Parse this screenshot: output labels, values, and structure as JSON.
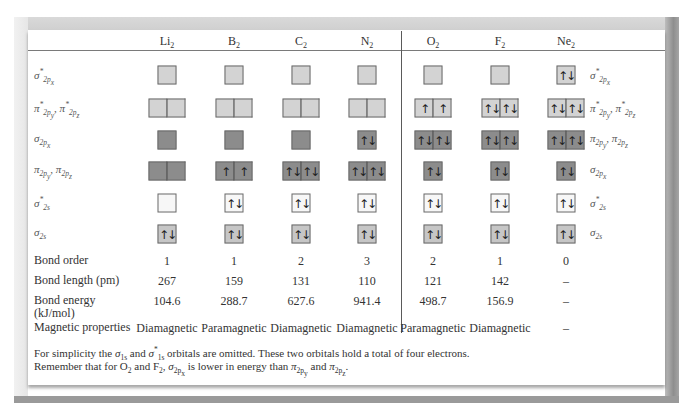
{
  "molecules": [
    {
      "symbol": "Li",
      "subscript": "2"
    },
    {
      "symbol": "B",
      "subscript": "2"
    },
    {
      "symbol": "C",
      "subscript": "2"
    },
    {
      "symbol": "N",
      "subscript": "2"
    },
    {
      "symbol": "O",
      "subscript": "2"
    },
    {
      "symbol": "F",
      "subscript": "2"
    },
    {
      "symbol": "Ne",
      "subscript": "2"
    }
  ],
  "orbital_rows": [
    {
      "key": "sigma_star_2px",
      "left_label": {
        "base": "σ",
        "sup": "*",
        "sub": "2p",
        "subsub": "x"
      },
      "right_label_b2_n2": null,
      "cells": [
        {
          "boxes": [
            ""
          ],
          "shade": "light"
        },
        {
          "boxes": [
            ""
          ],
          "shade": "light"
        },
        {
          "boxes": [
            ""
          ],
          "shade": "light"
        },
        {
          "boxes": [
            ""
          ],
          "shade": "light"
        },
        {
          "boxes": [
            ""
          ],
          "shade": "light"
        },
        {
          "boxes": [
            ""
          ],
          "shade": "light"
        },
        {
          "boxes": [
            "↑↓"
          ],
          "shade": "light"
        }
      ]
    },
    {
      "key": "pi_star_2py_2pz",
      "left_label": "π*2py, π*2pz",
      "cells": [
        {
          "boxes": [
            "",
            ""
          ],
          "shade": "light"
        },
        {
          "boxes": [
            "",
            ""
          ],
          "shade": "light"
        },
        {
          "boxes": [
            "",
            ""
          ],
          "shade": "light"
        },
        {
          "boxes": [
            "",
            ""
          ],
          "shade": "light"
        },
        {
          "boxes": [
            "↑",
            "↑"
          ],
          "shade": "light"
        },
        {
          "boxes": [
            "↑↓",
            "↑↓"
          ],
          "shade": "light"
        },
        {
          "boxes": [
            "↑↓",
            "↑↓"
          ],
          "shade": "light"
        }
      ]
    },
    {
      "key": "row3",
      "left_label": "σ2px",
      "right_label": "π2py, π2pz",
      "cells": [
        {
          "boxes": [
            ""
          ],
          "shade": "dark"
        },
        {
          "boxes": [
            ""
          ],
          "shade": "dark"
        },
        {
          "boxes": [
            ""
          ],
          "shade": "dark"
        },
        {
          "boxes": [
            "↑↓"
          ],
          "shade": "dark"
        },
        {
          "boxes": [
            "↑↓",
            "↑↓"
          ],
          "shade": "dark"
        },
        {
          "boxes": [
            "↑↓",
            "↑↓"
          ],
          "shade": "dark"
        },
        {
          "boxes": [
            "↑↓",
            "↑↓"
          ],
          "shade": "dark"
        }
      ]
    },
    {
      "key": "row4",
      "left_label": "π2py, π2pz",
      "right_label": "σ2px",
      "cells": [
        {
          "boxes": [
            "",
            ""
          ],
          "shade": "dark"
        },
        {
          "boxes": [
            "↑",
            "↑"
          ],
          "shade": "dark"
        },
        {
          "boxes": [
            "↑↓",
            "↑↓"
          ],
          "shade": "dark"
        },
        {
          "boxes": [
            "↑↓",
            "↑↓"
          ],
          "shade": "dark"
        },
        {
          "boxes": [
            "↑↓"
          ],
          "shade": "dark"
        },
        {
          "boxes": [
            "↑↓"
          ],
          "shade": "dark"
        },
        {
          "boxes": [
            "↑↓"
          ],
          "shade": "dark"
        }
      ]
    },
    {
      "key": "sigma_star_2s",
      "left_label": "σ*2s",
      "right_label": "σ*2s",
      "cells": [
        {
          "boxes": [
            ""
          ],
          "shade": "white"
        },
        {
          "boxes": [
            "↑↓"
          ],
          "shade": "white"
        },
        {
          "boxes": [
            "↑↓"
          ],
          "shade": "white"
        },
        {
          "boxes": [
            "↑↓"
          ],
          "shade": "white"
        },
        {
          "boxes": [
            "↑↓"
          ],
          "shade": "white"
        },
        {
          "boxes": [
            "↑↓"
          ],
          "shade": "white"
        },
        {
          "boxes": [
            "↑↓"
          ],
          "shade": "white"
        }
      ]
    },
    {
      "key": "sigma_2s",
      "left_label": "σ2s",
      "right_label": "σ2s",
      "cells": [
        {
          "boxes": [
            "↑↓"
          ],
          "shade": "mid"
        },
        {
          "boxes": [
            "↑↓"
          ],
          "shade": "mid"
        },
        {
          "boxes": [
            "↑↓"
          ],
          "shade": "mid"
        },
        {
          "boxes": [
            "↑↓"
          ],
          "shade": "mid"
        },
        {
          "boxes": [
            "↑↓"
          ],
          "shade": "mid"
        },
        {
          "boxes": [
            "↑↓"
          ],
          "shade": "mid"
        },
        {
          "boxes": [
            "↑↓"
          ],
          "shade": "mid"
        }
      ]
    }
  ],
  "properties": {
    "bond_order": {
      "label": "Bond order",
      "values": [
        "1",
        "1",
        "2",
        "3",
        "2",
        "1",
        "0"
      ]
    },
    "bond_length": {
      "label": "Bond length (pm)",
      "values": [
        "267",
        "159",
        "131",
        "110",
        "121",
        "142",
        "–"
      ]
    },
    "bond_energy": {
      "label_line1": "Bond energy",
      "label_line2": "(kJ/mol)",
      "values": [
        "104.6",
        "288.7",
        "627.6",
        "941.4",
        "498.7",
        "156.9",
        "–"
      ]
    },
    "magnetic": {
      "label": "Magnetic properties",
      "values": [
        "Diamagnetic",
        "Paramagnetic",
        "Diamagnetic",
        "Diamagnetic",
        "Paramagnetic",
        "Diamagnetic",
        "–"
      ]
    }
  },
  "footnotes": {
    "line1": {
      "pre": "For simplicity the ",
      "mid": " and ",
      "post": " orbitals are omitted.  These two orbitals hold a total of four electrons."
    },
    "line2": {
      "pre": "Remember that for O",
      "and_f": " and F",
      "comma": ", ",
      "lower": " is lower in energy than ",
      "and": " and ",
      "end": "."
    }
  },
  "colors": {
    "box_light": "#d3d3d3",
    "box_dark": "#8c8c8c",
    "box_white": "#f7f7f7",
    "box_mid": "#c6c6c6",
    "frame_gray": "#9a9a9a"
  }
}
